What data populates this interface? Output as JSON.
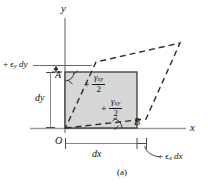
{
  "figure": {
    "caption": "(a)",
    "axes": {
      "y_label": "y",
      "x_label": "x",
      "origin_label": "O"
    },
    "points": {
      "a_label": "A",
      "b_label": "B"
    },
    "dimensions": {
      "dx_label": "dx",
      "dy_label": "dy"
    },
    "strain_labels": {
      "normal_y": "+ ϵ",
      "normal_y_sub": "y",
      "normal_y_tail": " dy",
      "normal_x": "+ ϵ",
      "normal_x_sub": "x",
      "normal_x_tail": " dx",
      "shear_numerator": "γ",
      "shear_numerator_sub": "xy",
      "shear_denominator": "2",
      "shear_sign": "+"
    },
    "colors": {
      "element_fill": "#d6d6d6",
      "element_stroke": "#3a3a3a",
      "dashed_stroke": "#2b2b2b",
      "axis_stroke": "#9a9a9a",
      "text": "#111111"
    }
  }
}
